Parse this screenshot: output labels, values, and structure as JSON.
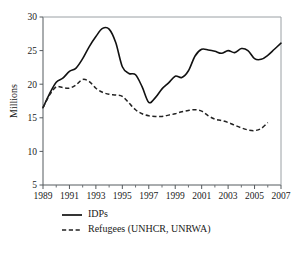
{
  "chart_data": {
    "type": "line",
    "title": "",
    "xlabel": "",
    "ylabel": "Millions",
    "xlim": [
      1989,
      2007
    ],
    "ylim": [
      5,
      30
    ],
    "grid": false,
    "legend_position": "below-plot-left",
    "y_ticks": [
      5,
      10,
      15,
      20,
      25,
      30
    ],
    "y_tick_labels": [
      "5",
      "10",
      "15",
      "20",
      "25",
      "30"
    ],
    "x_ticks": [
      1989,
      1990,
      1991,
      1992,
      1993,
      1994,
      1995,
      1996,
      1997,
      1998,
      1999,
      2000,
      2001,
      2002,
      2003,
      2004,
      2005,
      2006,
      2007
    ],
    "x_tick_labels": [
      "1989",
      "",
      "1991",
      "",
      "1993",
      "",
      "1995",
      "",
      "1997",
      "",
      "1999",
      "",
      "2001",
      "",
      "2003",
      "",
      "2005",
      "",
      "2007"
    ],
    "x_labeled_ticks": [
      "1989",
      "1991",
      "1993",
      "1995",
      "1997",
      "1999",
      "2001",
      "2003",
      "2005",
      "2007"
    ],
    "series": [
      {
        "name": "IDPs",
        "style": "solid",
        "color": "#111111",
        "x": [
          1989,
          1989.5,
          1990,
          1990.5,
          1991,
          1991.5,
          1992,
          1992.5,
          1993,
          1993.5,
          1994,
          1994.5,
          1995,
          1995.5,
          1996,
          1996.5,
          1997,
          1997.5,
          1998,
          1998.5,
          1999,
          1999.5,
          2000,
          2000.5,
          2001,
          2001.5,
          2002,
          2002.5,
          2003,
          2003.5,
          2004,
          2004.5,
          2005,
          2005.5,
          2006,
          2006.5,
          2007
        ],
        "values": [
          16.5,
          18.6,
          20.3,
          20.9,
          21.9,
          22.4,
          23.8,
          25.6,
          27.1,
          28.3,
          28.2,
          26.2,
          22.6,
          21.6,
          21.4,
          19.6,
          17.3,
          18.0,
          19.3,
          20.2,
          21.2,
          21.0,
          22.0,
          24.2,
          25.2,
          25.1,
          24.9,
          24.6,
          25.0,
          24.7,
          25.3,
          25.0,
          23.8,
          23.7,
          24.3,
          25.2,
          26.1
        ]
      },
      {
        "name": "Refugees (UNHCR, UNRWA)",
        "style": "dashed",
        "color": "#222222",
        "x": [
          1989,
          1989.5,
          1990,
          1990.5,
          1991,
          1991.5,
          1992,
          1992.5,
          1993,
          1993.5,
          1994,
          1994.5,
          1995,
          1995.5,
          1996,
          1996.5,
          1997,
          1997.5,
          1998,
          1998.5,
          1999,
          1999.5,
          2000,
          2000.5,
          2001,
          2001.5,
          2002,
          2002.5,
          2003,
          2003.5,
          2004,
          2004.5,
          2005,
          2005.5,
          2006
        ],
        "values": [
          16.5,
          18.4,
          19.6,
          19.5,
          19.4,
          19.9,
          20.7,
          20.4,
          19.4,
          18.8,
          18.5,
          18.4,
          18.2,
          17.2,
          16.2,
          15.6,
          15.3,
          15.2,
          15.2,
          15.4,
          15.6,
          15.9,
          16.1,
          16.2,
          16.0,
          15.3,
          14.8,
          14.6,
          14.3,
          13.9,
          13.5,
          13.2,
          13.1,
          13.4,
          14.3
        ]
      }
    ],
    "legend": [
      {
        "label": "IDPs",
        "style": "solid"
      },
      {
        "label": "Refugees (UNHCR, UNRWA)",
        "style": "dashed"
      }
    ]
  }
}
